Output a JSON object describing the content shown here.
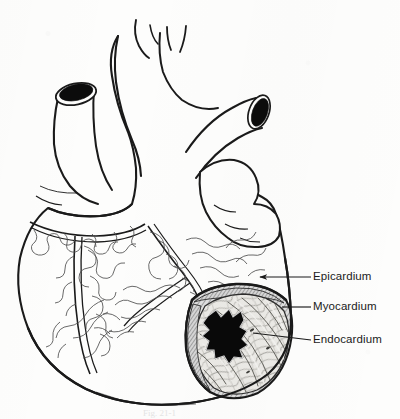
{
  "figure": {
    "background_color": "#fdfdfc",
    "ink_color": "#1a1a1a",
    "caption": "Fig. 21-1",
    "caption_visible": "partially cut off at bottom edge"
  },
  "labels": [
    {
      "id": "epicardium",
      "text": "Epicardium",
      "leader": {
        "from_x": 311,
        "from_y": 277,
        "to_x": 258,
        "to_y": 277,
        "arrowhead": true
      },
      "target": "outer serous layer on ventricular surface"
    },
    {
      "id": "myocardium",
      "text": "Myocardium",
      "leader": {
        "from_x": 311,
        "from_y": 307,
        "to_x": 282,
        "to_y": 307,
        "arrowhead": false
      },
      "target": "hatched muscular wall band in cut-away"
    },
    {
      "id": "endocardium",
      "text": "Endocardium",
      "leader": {
        "from_x": 311,
        "from_y": 340,
        "to_x": 253,
        "to_y": 333,
        "arrowhead": false
      },
      "target": "inner lining of ventricular chamber"
    }
  ],
  "structures": [
    {
      "name": "aortic-arch",
      "note": "top centre, with three branch vessels"
    },
    {
      "name": "superior-vena-cava-stump",
      "note": "upper left, cut end with black lumen"
    },
    {
      "name": "pulmonary-artery-stump",
      "note": "upper right, cut end with black lumen"
    },
    {
      "name": "right-atrium",
      "note": "left of midline below vena cava"
    },
    {
      "name": "left-atrial-appendage",
      "note": "right of pulmonary trunk"
    },
    {
      "name": "right-ventricle",
      "note": "large anterior chamber"
    },
    {
      "name": "left-ventricle",
      "note": "lower right, cut away"
    },
    {
      "name": "coronary-arteries",
      "note": "branching vessels with epicardial fat outlines"
    },
    {
      "name": "cut-away-window",
      "note": "ellipse exposing wall layers and chamber"
    },
    {
      "name": "ventricular-cavity",
      "note": "solid black irregular region inside cut-away"
    },
    {
      "name": "trabeculae-carneae",
      "note": "fibrous muscle texture lining the chamber"
    }
  ],
  "colors": {
    "ink": "#1a1a1a",
    "paper": "#fdfdfc",
    "cavity": "#0a0a0a",
    "hatch": "#8a8a8a",
    "muscle_tint": "#e3e3e0"
  }
}
